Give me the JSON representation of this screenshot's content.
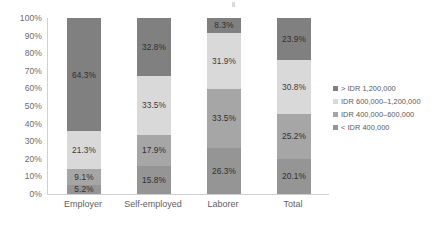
{
  "chart_data": {
    "type": "bar",
    "subtype": "100% stacked bar",
    "title": "",
    "subtitle": "",
    "xlabel": "",
    "ylabel": "",
    "categories": [
      "Employer",
      "Self-employed",
      "Laborer",
      "Total"
    ],
    "ylim": [
      0,
      100
    ],
    "yticks": [
      "0%",
      "10%",
      "20%",
      "30%",
      "40%",
      "50%",
      "60%",
      "70%",
      "80%",
      "90%",
      "100%"
    ],
    "ytick_values": [
      0,
      10,
      20,
      30,
      40,
      50,
      60,
      70,
      80,
      90,
      100
    ],
    "grid": false,
    "legend_position": "right",
    "stack_order_bottom_to_top": [
      "< IDR 400,000",
      "IDR 400,000–600,000",
      "IDR 600,000–1,200,000",
      "> IDR 1,200,000"
    ],
    "series": [
      {
        "name": "> IDR 1,200,000",
        "color": "#808080",
        "values": [
          64.3,
          32.8,
          8.3,
          23.9
        ],
        "labels": [
          "64.3%",
          "32.8%",
          "8.3%",
          "23.9%"
        ]
      },
      {
        "name": "IDR 600,000–1,200,000",
        "color": "#d9d9d9",
        "values": [
          21.3,
          33.5,
          31.9,
          30.8
        ],
        "labels": [
          "21.3%",
          "33.5%",
          "31.9%",
          "30.8%"
        ]
      },
      {
        "name": "IDR 400,000–600,000",
        "color": "#a6a6a6",
        "values": [
          9.1,
          17.9,
          33.5,
          25.2
        ],
        "labels": [
          "9.1%",
          "17.9%",
          "33.5%",
          "25.2%"
        ]
      },
      {
        "name": "< IDR 400,000",
        "color": "#959595",
        "values": [
          5.2,
          15.8,
          26.3,
          20.1
        ],
        "labels": [
          "5.2%",
          "15.8%",
          "26.3%",
          "20.1%"
        ]
      }
    ]
  },
  "legend": {
    "items": [
      {
        "label": "> IDR 1,200,000",
        "color": "#808080"
      },
      {
        "label": "IDR 600,000–1,200,000",
        "color": "#d9d9d9"
      },
      {
        "label": "IDR 400,000–600,000",
        "color": "#a6a6a6"
      },
      {
        "label": "< IDR 400,000",
        "color": "#959595"
      }
    ]
  }
}
